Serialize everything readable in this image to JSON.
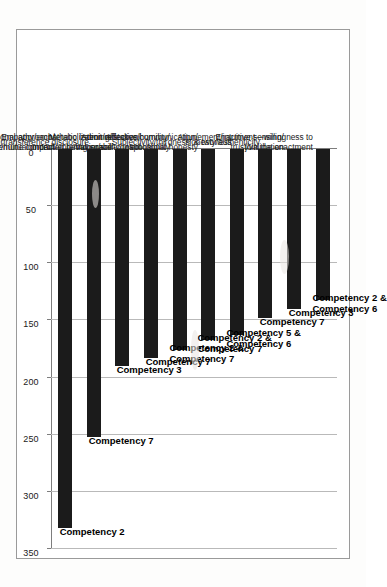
{
  "chart_data": {
    "type": "bar",
    "orientation": "horizontal",
    "title": "",
    "xlabel": "",
    "ylabel": "",
    "xlim": [
      0,
      350
    ],
    "grid": true,
    "legend": "none",
    "ticks": [
      "0",
      "50",
      "100",
      "150",
      "200",
      "250",
      "300",
      "350"
    ],
    "tick_values": [
      0,
      50,
      100,
      150,
      200,
      250,
      300,
      350
    ],
    "categories": [
      "Enactment—willingness to join the enactment",
      "Attunement/intuitive sensing/ trust/validation",
      "Honesty/authenticity",
      "Subjectivity/thirdness' & twoness",
      "Affective communication/ emotional honesty",
      "Admit mistakes/humility/ vulnerability/responsibility",
      "Metabolization/reflection/ controlled behavior/self-control",
      "Empathy/empathetic listening/ genuine concern/entering space",
      "Countertransference disclosure",
      "Mutuality/interpersonal approach/ equality/mutual impact"
    ],
    "category_lines": [
      [
        "Enactment—willingness to",
        "join the enactment"
      ],
      [
        "Attunement/intuitive sensing/",
        "trust/validation"
      ],
      [
        "Honesty/authenticity"
      ],
      [
        "Subjectivity/thirdness' & twoness"
      ],
      [
        "Affective communication/",
        "emotional honesty"
      ],
      [
        "Admit mistakes/humility/",
        "vulnerability/responsibility"
      ],
      [
        "Metabolization/reflection/",
        "controlled behavior/self-control"
      ],
      [
        "Empathy/empathetic listening/",
        "genuine concern/entering space"
      ],
      [
        "Countertransference disclosure"
      ],
      [
        "Mutuality/interpersonal approach/",
        "equality/mutual impact"
      ]
    ],
    "values": [
      132,
      140,
      148,
      163,
      167,
      176,
      183,
      190,
      252,
      332
    ],
    "point_labels": [
      "Competency 2 & Competency 6",
      "Competency 3",
      "Competency 7",
      "Competency 5 & Competency 6",
      "Competency 2 & Competency 7",
      "Competency 2 & Competency 7",
      "Competency 7",
      "Competency 3",
      "Competency 7",
      "Competency 2"
    ],
    "point_label_lines": [
      [
        "Competency 2 &",
        "Competency 6"
      ],
      [
        "Competency 3"
      ],
      [
        "Competency 7"
      ],
      [
        "Competency 5 &",
        "Competency 6"
      ],
      [
        "Competency 2 &",
        "Competency 7"
      ],
      [
        "Competency 2 &",
        "Competency 7"
      ],
      [
        "Competency 7"
      ],
      [
        "Competency 3"
      ],
      [
        "Competency 7"
      ],
      [
        "Competency 2"
      ]
    ],
    "colors": {
      "bar": "#1b1b1b",
      "gridline": "#b9b9b9",
      "axis": "#7d7d7d",
      "text": "#1a1a1a",
      "background": "#ffffff"
    }
  }
}
